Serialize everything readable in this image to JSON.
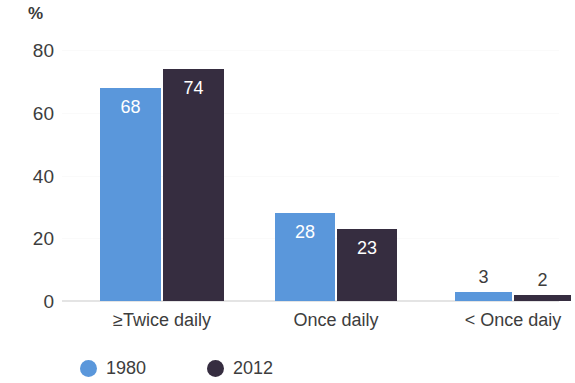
{
  "chart_data": {
    "type": "bar",
    "title": "",
    "subtitle": "",
    "xlabel": "",
    "ylabel": "%",
    "ylim": [
      0,
      80
    ],
    "yticks": [
      0,
      20,
      40,
      60,
      80
    ],
    "ytick_labels": [
      "0",
      "20",
      "40",
      "60",
      "80"
    ],
    "grid": true,
    "grid_axis": "y",
    "legend_position": "bottom-left",
    "categories": [
      "≥Twice daily",
      "Once daily",
      "< Once daiy"
    ],
    "series": [
      {
        "name": "1980",
        "color": "#5a97db",
        "values": [
          68,
          28,
          3
        ],
        "value_labels": [
          "68",
          "28",
          "3"
        ]
      },
      {
        "name": "2012",
        "color": "#362d40",
        "values": [
          74,
          23,
          2
        ],
        "value_labels": [
          "74",
          "23",
          "2"
        ]
      }
    ]
  },
  "axis": {
    "unit_label": "%"
  },
  "legend": {
    "items": [
      {
        "label": "1980",
        "color": "#5a97db"
      },
      {
        "label": "2012",
        "color": "#362d40"
      }
    ]
  },
  "colors": {
    "series_1980": "#5a97db",
    "series_2012": "#362d40",
    "text": "#3d3d3d",
    "gridline": "#fafafa",
    "baseline": "#e4e4e4",
    "background": "#ffffff"
  }
}
